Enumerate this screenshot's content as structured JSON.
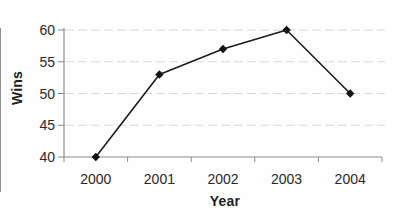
{
  "chart_data": {
    "type": "line",
    "categories": [
      "2000",
      "2001",
      "2002",
      "2003",
      "2004"
    ],
    "values": [
      40,
      53,
      57,
      60,
      50
    ],
    "series_name": "Wins",
    "title": "",
    "xlabel": "Year",
    "ylabel": "Wins",
    "ylim": [
      40,
      60
    ],
    "yticks": [
      40,
      45,
      50,
      55,
      60
    ],
    "grid": "horizontal-only",
    "legend": "none",
    "marker": "diamond",
    "colors": {
      "line": "#1c1c1c",
      "marker": "#111111",
      "axis": "#8c8c8c",
      "gridline": "#d7d7d7",
      "tick_label": "#2a2a2a"
    }
  }
}
